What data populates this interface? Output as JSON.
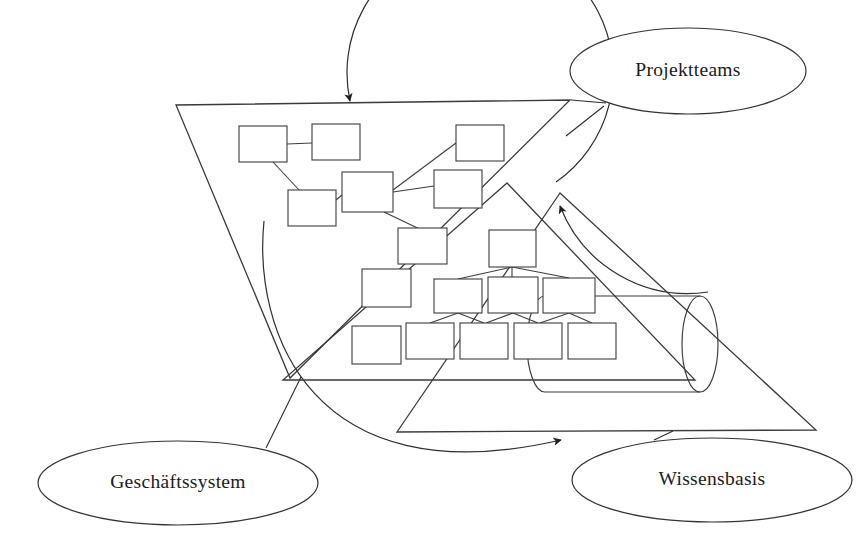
{
  "diagram": {
    "stroke_color": "#333333",
    "background_color": "#ffffff",
    "labels": [
      {
        "id": "projektteams",
        "text": "Projektteams",
        "cx": 688,
        "cy": 71,
        "rx": 118,
        "ry": 44
      },
      {
        "id": "geschaeftssystem",
        "text": "Geschäftssystem",
        "cx": 178,
        "cy": 483,
        "rx": 140,
        "ry": 42
      },
      {
        "id": "wissensbasis",
        "text": "Wissensbasis",
        "cx": 712,
        "cy": 480,
        "rx": 140,
        "ry": 42
      }
    ],
    "triangles": [
      {
        "id": "projektteams-triangle",
        "orientation": "inverted",
        "points": "176,105 570,100 290,378"
      },
      {
        "id": "geschaeftssystem-triangle",
        "orientation": "upright",
        "points": "507,183 283,380 695,380"
      },
      {
        "id": "wissensbasis-triangle",
        "orientation": "upright",
        "points": "560,193 397,432 816,430"
      }
    ],
    "network_boxes": [
      {
        "id": "n1",
        "x": 239,
        "y": 126,
        "w": 48,
        "h": 36
      },
      {
        "id": "n2",
        "x": 312,
        "y": 124,
        "w": 48,
        "h": 36
      },
      {
        "id": "n3",
        "x": 456,
        "y": 125,
        "w": 48,
        "h": 36
      },
      {
        "id": "n4",
        "x": 288,
        "y": 190,
        "w": 48,
        "h": 36
      },
      {
        "id": "n5",
        "x": 342,
        "y": 172,
        "w": 51,
        "h": 40
      },
      {
        "id": "n6",
        "x": 434,
        "y": 170,
        "w": 48,
        "h": 38
      },
      {
        "id": "n7",
        "x": 398,
        "y": 228,
        "w": 49,
        "h": 36
      },
      {
        "id": "n8",
        "x": 362,
        "y": 269,
        "w": 49,
        "h": 38
      },
      {
        "id": "n9",
        "x": 350,
        "y": 328,
        "w": 49,
        "h": 38
      }
    ],
    "network_links": [
      {
        "from": "n1",
        "to": "n2"
      },
      {
        "from": "n1",
        "to": "n4"
      },
      {
        "from": "n4",
        "to": "n5"
      },
      {
        "from": "n5",
        "to": "n3"
      },
      {
        "from": "n5",
        "to": "n6"
      },
      {
        "from": "n5",
        "to": "n7"
      }
    ],
    "hierarchy": {
      "top": [
        {
          "id": "h0",
          "x": 489,
          "y": 230,
          "w": 47,
          "h": 37
        }
      ],
      "middle": [
        {
          "id": "h1",
          "x": 434,
          "y": 279,
          "w": 48,
          "h": 34
        },
        {
          "id": "h2",
          "x": 488,
          "y": 277,
          "w": 50,
          "h": 36
        },
        {
          "id": "h3",
          "x": 543,
          "y": 278,
          "w": 52,
          "h": 35
        }
      ],
      "bottom": [
        {
          "id": "h4",
          "x": 406,
          "y": 323,
          "w": 48,
          "h": 36
        },
        {
          "id": "h5",
          "x": 460,
          "y": 323,
          "w": 48,
          "h": 36
        },
        {
          "id": "h6",
          "x": 514,
          "y": 323,
          "w": 48,
          "h": 36
        },
        {
          "id": "h7",
          "x": 568,
          "y": 323,
          "w": 48,
          "h": 36
        }
      ]
    },
    "lone_box": {
      "id": "lb",
      "x": 352,
      "y": 326,
      "w": 49,
      "h": 38
    },
    "database_cylinder": {
      "id": "knowledge-base-cylinder",
      "left_x": 545,
      "right_x": 700,
      "top_y": 296,
      "bottom_y": 392,
      "cap_rx": 18
    },
    "arrows": [
      {
        "id": "arrow-to-projektteams",
        "path": "M 556,180 A 132 132 0 1 0 348,100",
        "head_at": [
          345,
          103
        ],
        "head_angle": 152
      },
      {
        "id": "arrow-to-geschaeftssystem",
        "path": "M 706,300 A 135 135 0 0 1 560,205",
        "head_at": [
          556,
          207
        ],
        "head_angle": 212
      },
      {
        "id": "arrow-to-wissensbasis",
        "path": "M 265,222 C 258,340 330,500 560,440",
        "head_at": [
          566,
          436
        ],
        "head_angle": 325
      }
    ],
    "connectors": [
      {
        "id": "projektteams-connector",
        "path": "M 600,105 L 572,100"
      },
      {
        "id": "projektteams-connector-2",
        "path": "M 601,104 L 565,135"
      },
      {
        "id": "geschaeftssystem-connector",
        "path": "M 268,449 L 300,378"
      },
      {
        "id": "wissensbasis-connector",
        "path": "M 655,441 L 672,432"
      }
    ]
  }
}
